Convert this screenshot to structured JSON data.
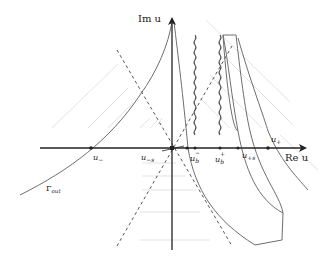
{
  "diagram": {
    "axes": {
      "imag_label": "Im u",
      "real_label": "Re u"
    },
    "points": [
      {
        "id": "u_minus",
        "label": "u",
        "sub": "−",
        "sup": ""
      },
      {
        "id": "u_minus_s",
        "label": "u",
        "sub": "−s",
        "sup": ""
      },
      {
        "id": "u_b_minus",
        "label": "u",
        "sub": "b",
        "sup": "−"
      },
      {
        "id": "u_b_plus",
        "label": "u",
        "sub": "b",
        "sup": "+"
      },
      {
        "id": "u_plus_s",
        "label": "u",
        "sub": "+s",
        "sup": ""
      },
      {
        "id": "u_plus",
        "label": "u",
        "sub": "+",
        "sup": ""
      }
    ],
    "contour_label": {
      "main": "Γ",
      "sub": "out"
    },
    "colors": {
      "axis": "#222222",
      "curve": "#6e6e6e",
      "dashed": "#555555",
      "faint": "#d8d8d8",
      "point": "#222222"
    }
  }
}
